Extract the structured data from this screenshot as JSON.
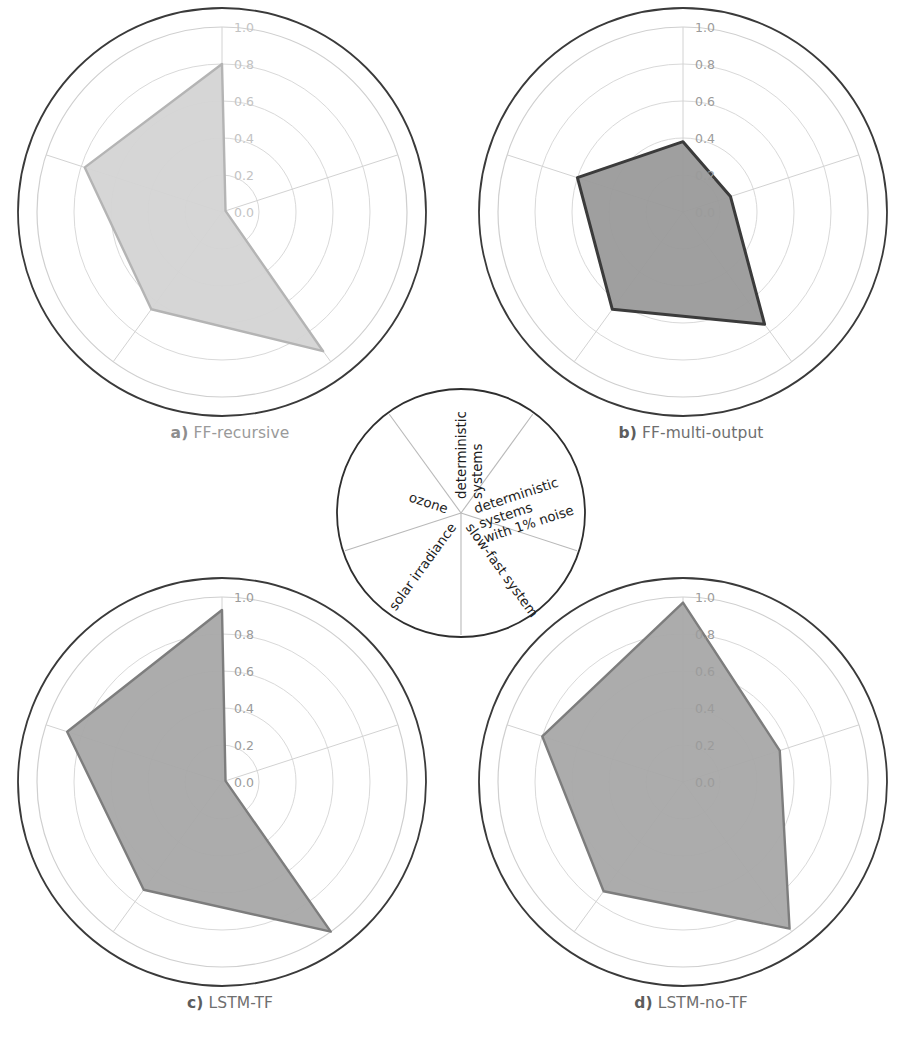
{
  "figure": {
    "background": "#ffffff",
    "radial_tick_labels": [
      "0.0",
      "0.2",
      "0.4",
      "0.6",
      "0.8",
      "1.0"
    ],
    "axis_labels": [
      "deterministic systems",
      "deterministic systems with 1% noise",
      "slow-fast system",
      "solar irradiance",
      "ozone"
    ]
  },
  "legend_wheel": {
    "name": "axis-legend-wheel",
    "sectors": [
      {
        "label_lines": [
          "deterministic",
          "systems"
        ],
        "angle_deg": 0
      },
      {
        "label_lines": [
          "deterministic",
          "systems",
          "with 1% noise"
        ],
        "angle_deg": 72
      },
      {
        "label_lines": [
          "slow-fast system"
        ],
        "angle_deg": 144
      },
      {
        "label_lines": [
          "solar irradiance"
        ],
        "angle_deg": 216
      },
      {
        "label_lines": [
          "ozone"
        ],
        "angle_deg": 288
      }
    ]
  },
  "panels": [
    {
      "id": "a",
      "tag": "a)",
      "title": "FF-recursive",
      "fill": "#d4d4d4",
      "stroke": "#b4b4b4",
      "values": [
        0.8,
        0.02,
        0.93,
        0.65,
        0.78
      ]
    },
    {
      "id": "b",
      "tag": "b)",
      "title": "FF-multi-output",
      "fill": "#9a9a9a",
      "stroke": "#3b3b3b",
      "values": [
        0.38,
        0.27,
        0.75,
        0.65,
        0.6
      ]
    },
    {
      "id": "c",
      "tag": "c)",
      "title": "LSTM-TF",
      "fill": "#a8a8a8",
      "stroke": "#7d7d7d",
      "values": [
        0.93,
        0.02,
        1.0,
        0.72,
        0.88
      ]
    },
    {
      "id": "d",
      "tag": "d)",
      "title": "LSTM-no-TF",
      "fill": "#a8a8a8",
      "stroke": "#7d7d7d",
      "values": [
        0.97,
        0.55,
        0.98,
        0.73,
        0.8
      ]
    }
  ],
  "chart_data": {
    "type": "radar",
    "title": "",
    "categories": [
      "deterministic systems",
      "deterministic systems with 1% noise",
      "slow-fast system",
      "solar irradiance",
      "ozone"
    ],
    "rlim": [
      0.0,
      1.0
    ],
    "rticks": [
      0.0,
      0.2,
      0.4,
      0.6,
      0.8,
      1.0
    ],
    "grid": true,
    "legend_position": "center-wheel",
    "series": [
      {
        "name": "a) FF-recursive",
        "values": [
          0.8,
          0.02,
          0.93,
          0.65,
          0.78
        ]
      },
      {
        "name": "b) FF-multi-output",
        "values": [
          0.38,
          0.27,
          0.75,
          0.65,
          0.6
        ]
      },
      {
        "name": "c) LSTM-TF",
        "values": [
          0.93,
          0.02,
          1.0,
          0.72,
          0.88
        ]
      },
      {
        "name": "d) LSTM-no-TF",
        "values": [
          0.97,
          0.55,
          0.98,
          0.73,
          0.8
        ]
      }
    ],
    "subplots": [
      {
        "label": "a",
        "name": "FF-recursive",
        "values": [
          0.8,
          0.02,
          0.93,
          0.65,
          0.78
        ]
      },
      {
        "label": "b",
        "name": "FF-multi-output",
        "values": [
          0.38,
          0.27,
          0.75,
          0.65,
          0.6
        ]
      },
      {
        "label": "c",
        "name": "LSTM-TF",
        "values": [
          0.93,
          0.02,
          1.0,
          0.72,
          0.88
        ]
      },
      {
        "label": "d",
        "name": "LSTM-no-TF",
        "values": [
          0.97,
          0.55,
          0.98,
          0.73,
          0.8
        ]
      }
    ]
  }
}
